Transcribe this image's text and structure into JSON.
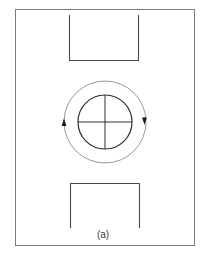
{
  "figure": {
    "caption": "(a)",
    "colors": {
      "background": "#ffffff",
      "frame": "#7a7a7a",
      "rectangles": "#4a4a4a",
      "inner_circle": "#2e2e2e",
      "crosshair": "#2e2e2e",
      "rotation_ring": "#9a9a9a",
      "arrows": "#1a1a1a",
      "caption": "#3a3a3a"
    },
    "elements": {
      "frame": {
        "x": 15,
        "y": 9,
        "width": 179,
        "height": 236
      },
      "top_bracket": {
        "x1": 69,
        "x2": 138,
        "y_open": 15,
        "y_closed": 60,
        "open_side": "top"
      },
      "bottom_bracket": {
        "x1": 70,
        "x2": 139,
        "y_closed": 183,
        "y_open": 228,
        "open_side": "bottom"
      },
      "inner_circle": {
        "cx": 105,
        "cy": 122,
        "r": 27
      },
      "rotation_ring": {
        "cx": 105,
        "cy": 122,
        "r": 41,
        "direction": "clockwise"
      },
      "arrows": [
        {
          "position": "left",
          "x": 65,
          "y": 124,
          "pointing": "up"
        },
        {
          "position": "right",
          "x": 144,
          "y": 120,
          "pointing": "down"
        }
      ]
    }
  }
}
